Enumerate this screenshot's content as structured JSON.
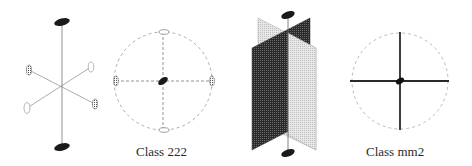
{
  "figure": {
    "panels": [
      {
        "id": "class-222",
        "label": "Class 222",
        "description": "Three mutually perpendicular 2-fold axes and stereographic projection"
      },
      {
        "id": "class-mm2",
        "label": "Class mm2",
        "description": "One 2-fold axis with two perpendicular mirror planes and stereographic projection"
      }
    ]
  },
  "colors": {
    "ink": "#1a1a1a",
    "dashed": "#8a8a8a",
    "light_plane": "#dcdcdc",
    "dark_plane": "#3c3c3c"
  }
}
